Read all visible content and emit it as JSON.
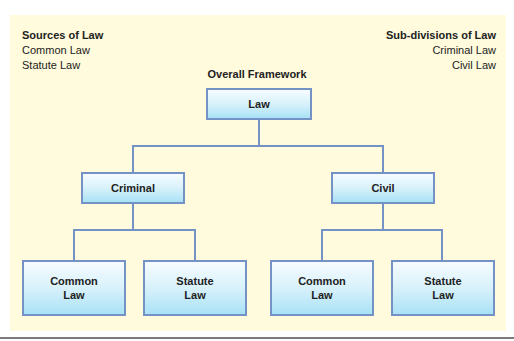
{
  "legend_left": {
    "heading": "Sources of Law",
    "items": [
      "Common Law",
      "Statute Law"
    ]
  },
  "legend_right": {
    "heading": "Sub-divisions of Law",
    "items": [
      "Criminal Law",
      "Civil Law"
    ]
  },
  "diagram": {
    "title": "Overall Framework",
    "root": {
      "label": "Law"
    },
    "branches": [
      {
        "label": "Criminal",
        "children": [
          {
            "line1": "Common",
            "line2": "Law"
          },
          {
            "line1": "Statute",
            "line2": "Law"
          }
        ]
      },
      {
        "label": "Civil",
        "children": [
          {
            "line1": "Common",
            "line2": "Law"
          },
          {
            "line1": "Statute",
            "line2": "Law"
          }
        ]
      }
    ]
  },
  "colors": {
    "panel_background": "#fffbdc",
    "node_border": "#7492c6",
    "node_fill_top": "#f6fcff",
    "node_fill_bottom": "#a9e2f6",
    "text": "#222222"
  }
}
